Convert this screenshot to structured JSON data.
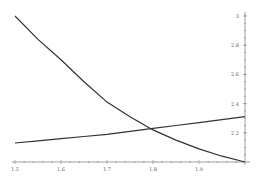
{
  "chart_data": {
    "type": "line",
    "title": "",
    "xlabel": "",
    "ylabel": "",
    "xlim": [
      1.5,
      2.0
    ],
    "ylim": [
      2.0,
      3.0
    ],
    "grid": false,
    "legend": null,
    "x_ticks": [
      "1.5",
      "1.6",
      "1.7",
      "1.8",
      "1.9"
    ],
    "y_ticks": [
      "2.2",
      "2.4",
      "2.6",
      "2.8",
      "3"
    ],
    "y_axis_position": "right (at x=2)",
    "x": [
      1.5,
      1.55,
      1.6,
      1.65,
      1.7,
      1.75,
      1.8,
      1.85,
      1.9,
      1.95,
      2.0
    ],
    "series": [
      {
        "name": "decreasing curve",
        "values": [
          3.0,
          2.84,
          2.7,
          2.55,
          2.41,
          2.31,
          2.22,
          2.15,
          2.09,
          2.04,
          2.0
        ]
      },
      {
        "name": "increasing line",
        "values": [
          2.13,
          2.145,
          2.16,
          2.175,
          2.19,
          2.21,
          2.23,
          2.25,
          2.27,
          2.29,
          2.31
        ]
      }
    ],
    "annotations": [
      {
        "text": "intersection",
        "x": 1.81,
        "y": 2.23
      }
    ]
  }
}
